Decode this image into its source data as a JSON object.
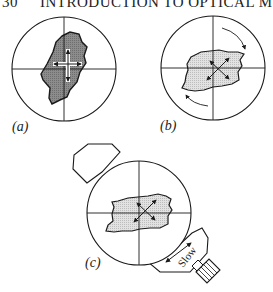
{
  "header": {
    "page_number": "30",
    "running_title": "INTRODUCTION TO OPTICAL MIN"
  },
  "figure": {
    "panels": [
      {
        "label": "(a)",
        "description": "Grain at extinction: vibration directions aligned with crosshairs; dark gray grain"
      },
      {
        "label": "(b)",
        "description": "Stage rotated 45°: grain at maximum brightness; curved rotation arrows; light gray grain"
      },
      {
        "label": "(c)",
        "description": "Accessory plate inserted in diagonal slot with slow direction marked"
      }
    ],
    "accessory_plate_text": "Slow",
    "colors": {
      "line": "#1a1a1a",
      "grain_dark": "#8a8a8a",
      "grain_light": "#dcdcdc",
      "background": "#ffffff"
    }
  }
}
